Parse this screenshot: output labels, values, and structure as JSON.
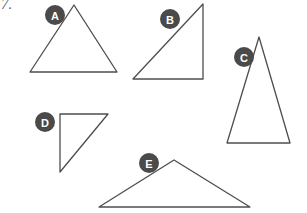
{
  "page": {
    "question_number": "7.",
    "background_color": "#ffffff",
    "stroke_color": "#4d4d4d",
    "badge_fill_color": "#4a4a4a",
    "badge_text_color": "#ffffff",
    "width": 307,
    "height": 213
  },
  "figures": [
    {
      "label": "A",
      "name": "triangle-a",
      "shape": "triangle",
      "description": "acute isosceles triangle, apex at top",
      "points": "74,5 30,72 117,72",
      "badge": {
        "cx": 55,
        "cy": 15,
        "r": 10
      }
    },
    {
      "label": "B",
      "name": "triangle-b",
      "shape": "triangle",
      "description": "right triangle, right angle at bottom right",
      "points": "203,4 203,79 133,79",
      "badge": {
        "cx": 170,
        "cy": 19,
        "r": 10
      }
    },
    {
      "label": "C",
      "name": "triangle-c",
      "shape": "triangle",
      "description": "tall isosceles triangle, apex at top",
      "points": "259,37 227,143 290,143",
      "badge": {
        "cx": 244,
        "cy": 57,
        "r": 10
      }
    },
    {
      "label": "D",
      "name": "triangle-d",
      "shape": "triangle",
      "description": "right triangle, right angle at top left",
      "points": "60,114 108,114 60,172",
      "badge": {
        "cx": 45,
        "cy": 122,
        "r": 10
      }
    },
    {
      "label": "E",
      "name": "triangle-e",
      "shape": "triangle",
      "description": "wide obtuse triangle, apex at top center",
      "points": "174,160 250,207 99,207",
      "badge": {
        "cx": 149,
        "cy": 163,
        "r": 10
      }
    }
  ]
}
